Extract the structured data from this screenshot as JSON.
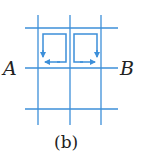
{
  "diagram": {
    "label_left": "A",
    "label_right": "B",
    "caption": "(b)",
    "line_color": "#3d8fd9",
    "grid": {
      "vertical_lines_x": [
        38,
        70,
        101
      ],
      "horizontal_lines_y": [
        28,
        68,
        109
      ]
    },
    "loops": [
      {
        "name": "left-loop",
        "direction": "counterclockwise",
        "arrows": [
          "down",
          "left"
        ]
      },
      {
        "name": "right-loop",
        "direction": "clockwise",
        "arrows": [
          "down",
          "right"
        ]
      }
    ]
  }
}
